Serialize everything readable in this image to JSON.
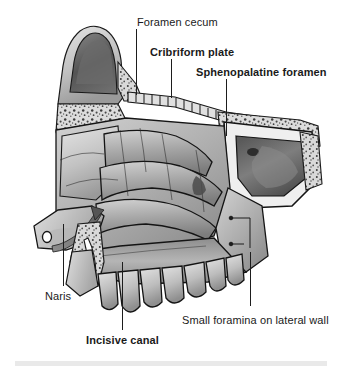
{
  "figure": {
    "background_color": "#ffffff",
    "width": 342,
    "height": 370,
    "style": "grayscale medical illustration"
  },
  "labels": [
    {
      "id": "foramen-cecum",
      "text": "Foramen cecum",
      "bold": false,
      "x": 137,
      "y": 16,
      "leader": {
        "x": 136,
        "y": 29,
        "height": 66
      }
    },
    {
      "id": "cribriform-plate",
      "text": "Cribriform plate",
      "bold": true,
      "x": 150,
      "y": 46,
      "leader": {
        "x": 171,
        "y": 59,
        "height": 39
      }
    },
    {
      "id": "sphenopalatine-foramen",
      "text": "Sphenopalatine foramen",
      "bold": true,
      "x": 196,
      "y": 66,
      "leader": {
        "x": 226,
        "y": 79,
        "height": 57
      }
    },
    {
      "id": "naris",
      "text": "Naris",
      "bold": false,
      "x": 45,
      "y": 290,
      "leader": {
        "x": 63,
        "y": 224,
        "height": 62
      }
    },
    {
      "id": "incisive-canal",
      "text": "Incisive canal",
      "bold": true,
      "x": 86,
      "y": 334,
      "leader": {
        "x": 122,
        "y": 262,
        "height": 68
      }
    },
    {
      "id": "small-foramina-lateral-wall",
      "text": "Small foramina on lateral wall",
      "bold": false,
      "x": 182,
      "y": 314,
      "leader": {
        "x": 250,
        "y": 252,
        "height": 54
      }
    }
  ],
  "anatomy": {
    "structures": [
      "frontal sinus",
      "cribriform plate",
      "sphenoid sinus",
      "superior concha",
      "middle concha",
      "inferior concha",
      "hard palate",
      "maxillary teeth",
      "nasal vestibule"
    ],
    "airflow_arrow": {
      "label": "airflow-arrow",
      "direction": "up-and-posterior through naris"
    }
  },
  "footer": {
    "band_color": "#e9e9e9"
  },
  "colors": {
    "ink": "#1a1a1a",
    "leader": "#1d1d1d",
    "bone_light": "#d8d8d8",
    "bone_mid": "#a8a8a8",
    "bone_dark": "#6d6d6d",
    "cavity_dark": "#3a3a3a",
    "outline": "#141414"
  }
}
